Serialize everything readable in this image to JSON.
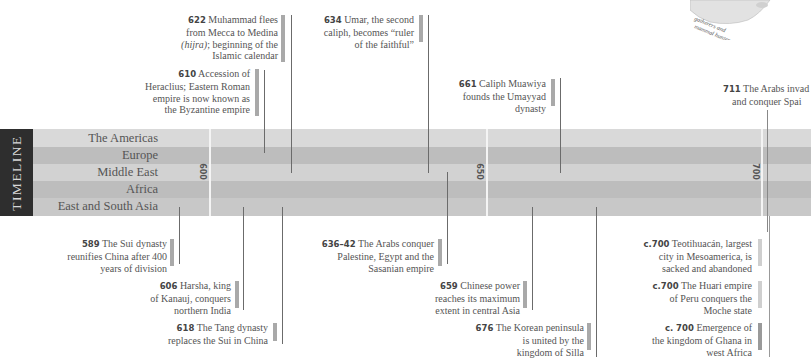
{
  "sidebar": {
    "title": "TIMELINE"
  },
  "bands": [
    {
      "label": "The Americas"
    },
    {
      "label": "Europe"
    },
    {
      "label": "Middle East"
    },
    {
      "label": "Africa"
    },
    {
      "label": "East and South Asia"
    }
  ],
  "years": [
    "600",
    "650",
    "700"
  ],
  "map_fragment": {
    "caption_line1": "gatherers and",
    "caption_line2": "mammal hunters"
  },
  "events_above": [
    {
      "year": "622",
      "text1": "Muhammad flees",
      "text2": "from Mecca to Medina",
      "text3_italic": "(hijra)",
      "text3": "; beginning of the",
      "text4": "Islamic calendar"
    },
    {
      "year": "610",
      "text1": "Accession of",
      "text2": "Heraclius; Eastern Roman",
      "text3": "empire is now known as",
      "text4": "the Byzantine empire"
    },
    {
      "year": "634",
      "text1": "Umar, the second",
      "text2": "caliph, becomes “ruler",
      "text3": "of the faithful”"
    },
    {
      "year": "661",
      "text1": "Caliph Muawiya",
      "text2": "founds the Umayyad",
      "text3": "dynasty"
    },
    {
      "year": "711",
      "text1": "The Arabs invad",
      "text2": "and conquer Spai"
    }
  ],
  "events_below": [
    {
      "year": "589",
      "text1": "The Sui dynasty",
      "text2": "reunifies China after 400",
      "text3": "years of division"
    },
    {
      "year": "606",
      "text1": "Harsha, king",
      "text2": "of Kanauj, conquers",
      "text3": "northern India"
    },
    {
      "year": "618",
      "text1": "The Tang dynasty",
      "text2": "replaces the Sui in China"
    },
    {
      "year": "636–42",
      "text1": "The Arabs conquer",
      "text2": "Palestine, Egypt and the",
      "text3": "Sasanian empire"
    },
    {
      "year": "659",
      "text1": "Chinese power",
      "text2": "reaches its maximum",
      "text3": "extent in central Asia"
    },
    {
      "year": "676",
      "text1": "The Korean peninsula",
      "text2": "is united by the",
      "text3": "kingdom of Silla"
    },
    {
      "year": "c.700",
      "text1": "Teotihuacán, largest",
      "text2": "city in Mesoamerica, is",
      "text3": "sacked and abandoned"
    },
    {
      "year": "c.700",
      "text1": "The Huari empire",
      "text2": "of Peru conquers the",
      "text3": "Moche state"
    },
    {
      "year": "c. 700",
      "text1": "Emergence of",
      "text2": "the kingdom of Ghana in",
      "text3": "west Africa"
    }
  ],
  "colors": {
    "band_light": "#d9d9d9",
    "band_dark": "#bdbdbd",
    "strip": "#2e2e2e",
    "marker": "#a9a9a9"
  }
}
